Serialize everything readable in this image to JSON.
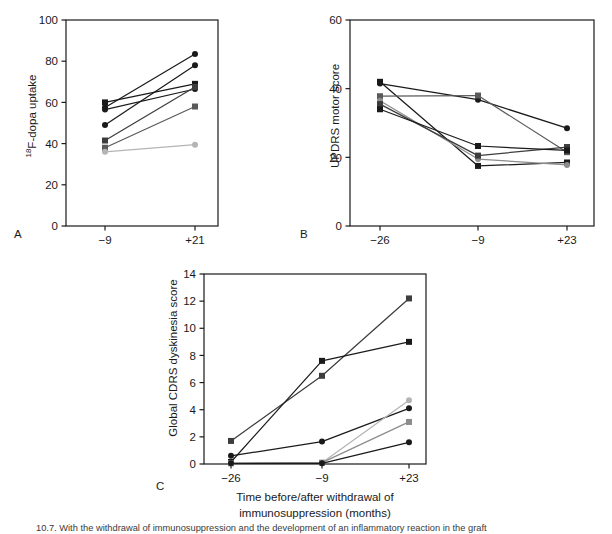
{
  "figure": {
    "panel_letters": [
      "A",
      "B",
      "C"
    ],
    "xaxis_title_line1": "Time before/after withdrawal of",
    "xaxis_title_line2": "immunosuppression (months)",
    "caption": "10.7. With the withdrawal of immunosuppression and the development of an inflammatory reaction in the graft"
  },
  "chart_data": [
    {
      "panel": "A",
      "type": "line",
      "title": "",
      "xlabel": "",
      "ylabel": "18F-dopa uptake",
      "ylabel_display": "¹⁸F-dopa uptake",
      "x": [
        -9,
        21
      ],
      "xtick_labels": [
        "−9",
        "+21"
      ],
      "ylim": [
        0,
        100
      ],
      "yticks": [
        0,
        20,
        40,
        60,
        80,
        100
      ],
      "ytick_labels": [
        "0",
        "20",
        "40",
        "60",
        "80",
        "100"
      ],
      "grid": false,
      "legend": "none",
      "series": [
        {
          "name": "subject-1",
          "marker": "square",
          "color": "#1a1a1a",
          "values": [
            60.0,
            69.0
          ]
        },
        {
          "name": "subject-2",
          "marker": "circle",
          "color": "#1a1a1a",
          "values": [
            57.5,
            83.5
          ]
        },
        {
          "name": "subject-3",
          "marker": "circle",
          "color": "#1a1a1a",
          "values": [
            56.5,
            66.5
          ]
        },
        {
          "name": "subject-4",
          "marker": "circle",
          "color": "#1a1a1a",
          "values": [
            49.0,
            78.0
          ]
        },
        {
          "name": "subject-5",
          "marker": "square",
          "color": "#3d3d3d",
          "values": [
            41.5,
            67.5
          ]
        },
        {
          "name": "subject-6",
          "marker": "square",
          "color": "#5a5a5a",
          "values": [
            38.0,
            58.0
          ]
        },
        {
          "name": "subject-7",
          "marker": "circle",
          "color": "#b4b4b4",
          "values": [
            36.0,
            39.5
          ]
        }
      ]
    },
    {
      "panel": "B",
      "type": "line",
      "title": "",
      "xlabel": "",
      "ylabel": "UPDRS motor score",
      "ylabel_display": "UPDRS motor score",
      "x": [
        -26,
        -9,
        23
      ],
      "xtick_labels": [
        "−26",
        "−9",
        "+23"
      ],
      "ylim": [
        0,
        60
      ],
      "yticks": [
        0,
        20,
        40,
        60
      ],
      "ytick_labels": [
        "0",
        "20",
        "40",
        "60"
      ],
      "grid": false,
      "legend": "none",
      "series": [
        {
          "name": "subject-1",
          "marker": "square",
          "color": "#1a1a1a",
          "values": [
            42.0,
            17.5,
            18.5
          ]
        },
        {
          "name": "subject-2",
          "marker": "circle",
          "color": "#1a1a1a",
          "values": [
            41.5,
            36.8,
            28.5
          ]
        },
        {
          "name": "subject-3",
          "marker": "square",
          "color": "#5a5a5a",
          "values": [
            37.8,
            38.0,
            21.5
          ]
        },
        {
          "name": "subject-4",
          "marker": "circle",
          "color": "#8c8c8c",
          "values": [
            36.5,
            19.5,
            17.8
          ]
        },
        {
          "name": "subject-5",
          "marker": "square",
          "color": "#3d3d3d",
          "values": [
            35.5,
            20.5,
            23.0
          ]
        },
        {
          "name": "subject-6",
          "marker": "square",
          "color": "#1a1a1a",
          "values": [
            34.0,
            23.3,
            22.0
          ]
        }
      ]
    },
    {
      "panel": "C",
      "type": "line",
      "title": "",
      "xlabel": "Time before/after withdrawal of immunosuppression (months)",
      "ylabel": "Global CDRS dyskinesia score",
      "ylabel_display": "Global CDRS dyskinesia score",
      "x": [
        -26,
        -9,
        23
      ],
      "xtick_labels": [
        "−26",
        "−9",
        "+23"
      ],
      "ylim": [
        0,
        14
      ],
      "yticks": [
        0,
        2,
        4,
        6,
        8,
        10,
        12,
        14
      ],
      "ytick_labels": [
        "0",
        "2",
        "4",
        "6",
        "8",
        "10",
        "12",
        "14"
      ],
      "grid": false,
      "legend": "none",
      "series": [
        {
          "name": "subject-1",
          "marker": "square",
          "color": "#3d3d3d",
          "values": [
            1.7,
            6.5,
            12.2
          ]
        },
        {
          "name": "subject-2",
          "marker": "square",
          "color": "#1a1a1a",
          "values": [
            0.15,
            7.6,
            9.0
          ]
        },
        {
          "name": "subject-3",
          "marker": "circle",
          "color": "#1a1a1a",
          "values": [
            0.6,
            1.65,
            4.1
          ]
        },
        {
          "name": "subject-4",
          "marker": "circle",
          "color": "#b4b4b4",
          "values": [
            0.05,
            0.1,
            4.7
          ]
        },
        {
          "name": "subject-5",
          "marker": "square",
          "color": "#8c8c8c",
          "values": [
            0.05,
            0.1,
            3.1
          ]
        },
        {
          "name": "subject-6",
          "marker": "circle",
          "color": "#1a1a1a",
          "values": [
            0.05,
            0.05,
            1.6
          ]
        }
      ]
    }
  ]
}
